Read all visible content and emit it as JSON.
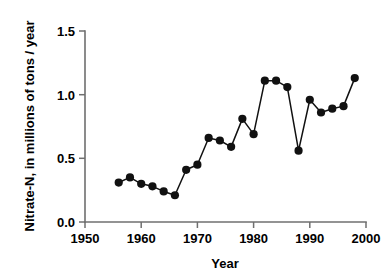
{
  "chart_data": {
    "type": "line",
    "title": "",
    "xlabel": "Year",
    "ylabel": "Nitrate-N, in millions of tons / year",
    "xlim": [
      1950,
      2000
    ],
    "ylim": [
      0.0,
      1.5
    ],
    "xticks": [
      1950,
      1960,
      1970,
      1980,
      1990,
      2000
    ],
    "xtick_labels": [
      "1950",
      "1960",
      "1970",
      "1980",
      "1990",
      "2000"
    ],
    "yticks": [
      0.0,
      0.5,
      1.0,
      1.5
    ],
    "ytick_labels": [
      "0.0",
      "0.5",
      "1.0",
      "1.5"
    ],
    "grid": false,
    "legend": false,
    "marker": "filled-circle",
    "line_color": "#111111",
    "marker_color": "#111111",
    "axis_color": "#6f6f6f",
    "x": [
      1956,
      1958,
      1960,
      1962,
      1964,
      1966,
      1968,
      1970,
      1972,
      1974,
      1976,
      1978,
      1980,
      1982,
      1984,
      1986,
      1988,
      1990,
      1992,
      1994,
      1996,
      1998
    ],
    "values": [
      0.31,
      0.35,
      0.3,
      0.28,
      0.24,
      0.21,
      0.41,
      0.45,
      0.66,
      0.64,
      0.59,
      0.81,
      0.69,
      1.11,
      1.11,
      1.06,
      0.56,
      0.96,
      0.86,
      0.89,
      0.91,
      1.13
    ],
    "series": [
      {
        "name": "Nitrate-N flux",
        "values": [
          0.31,
          0.35,
          0.3,
          0.28,
          0.24,
          0.21,
          0.41,
          0.45,
          0.66,
          0.64,
          0.59,
          0.81,
          0.69,
          1.11,
          1.11,
          1.06,
          0.56,
          0.96,
          0.86,
          0.89,
          0.91,
          1.13
        ]
      }
    ]
  }
}
